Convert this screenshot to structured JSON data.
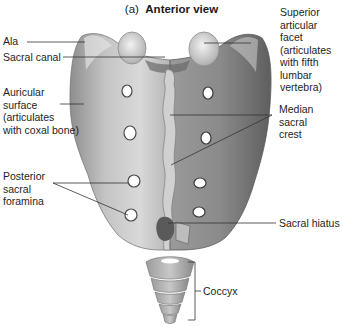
{
  "figure": {
    "panel": "(a)",
    "title": "Anterior view"
  },
  "labels": {
    "ala": "Ala",
    "sacral_canal": "Sacral canal",
    "auricular_surface": "Auricular\nsurface\n(articulates\nwith coxal bone)",
    "posterior_sacral_foramina": "Posterior\nsacral\nforamina",
    "superior_articular_facet": "Superior\narticular facet\n(articulates\nwith fifth\nlumbar\nvertebra)",
    "median_sacral_crest": "Median sacral\ncrest",
    "sacral_hiatus": "Sacral hiatus",
    "coccyx": "Coccyx"
  },
  "colors": {
    "bone_light": "#d6d6d6",
    "bone_mid": "#a9a9a9",
    "bone_dark": "#6e6e6e",
    "leader_line": "#333333"
  }
}
